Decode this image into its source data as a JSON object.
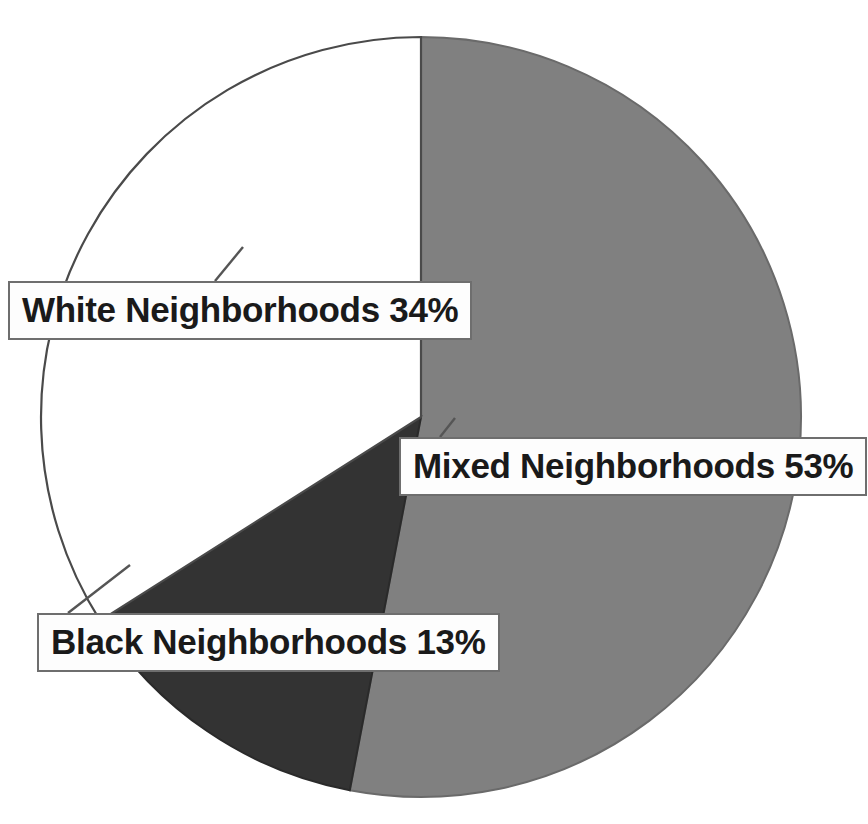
{
  "chart_data": {
    "type": "pie",
    "title": "",
    "subtitle": "",
    "xlabel": "",
    "ylabel": "",
    "legend_position": "none",
    "grid": false,
    "unit": "%",
    "start_angle_deg": 0,
    "direction": "clockwise",
    "categories": [
      "Mixed Neighborhoods",
      "White Neighborhoods",
      "Black Neighborhoods"
    ],
    "values": [
      53,
      34,
      13
    ],
    "slices": [
      {
        "name": "Mixed Neighborhoods",
        "value": 53,
        "label": "Mixed Neighborhoods 53%",
        "color": "#808080",
        "start_deg": 0,
        "end_deg": 190.8
      },
      {
        "name": "Black Neighborhoods",
        "value": 13,
        "label": "Black Neighborhoods 13%",
        "color": "#333333",
        "start_deg": 190.8,
        "end_deg": 237.6
      },
      {
        "name": "White Neighborhoods",
        "value": 34,
        "label": "White Neighborhoods 34%",
        "color": "#ffffff",
        "start_deg": 237.6,
        "end_deg": 360
      }
    ]
  },
  "labels": {
    "white": "White Neighborhoods 34%",
    "mixed": "Mixed Neighborhoods 53%",
    "black": "Black Neighborhoods 13%"
  },
  "colors": {
    "mixed_slice": "#808080",
    "black_slice": "#333333",
    "white_slice": "#ffffff",
    "slice_outline": "#4a4a4a",
    "label_border": "#6e6e6e",
    "label_background": "#fdfdfd",
    "label_text": "#1a1a1a",
    "leader_line": "#555555",
    "page_background": "#ffffff"
  }
}
